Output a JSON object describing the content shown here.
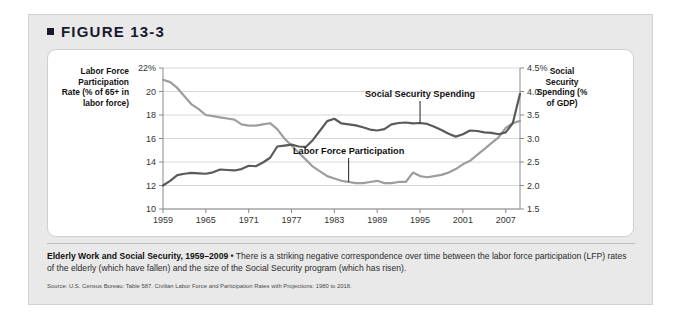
{
  "figure": {
    "header_label": "FIGURE 13-3",
    "bullet_glyph": "■"
  },
  "chart_data": {
    "type": "line",
    "title": "",
    "xlabel": "",
    "grid": "horizontal",
    "legend_position": "inline-annotations",
    "x": [
      1959,
      1960,
      1961,
      1962,
      1963,
      1964,
      1965,
      1966,
      1967,
      1968,
      1969,
      1970,
      1971,
      1972,
      1973,
      1974,
      1975,
      1976,
      1977,
      1978,
      1979,
      1980,
      1981,
      1982,
      1983,
      1984,
      1985,
      1986,
      1987,
      1988,
      1989,
      1990,
      1991,
      1992,
      1993,
      1994,
      1995,
      1996,
      1997,
      1998,
      1999,
      2000,
      2001,
      2002,
      2003,
      2004,
      2005,
      2006,
      2007,
      2008,
      2009
    ],
    "xlim": [
      1959,
      2009
    ],
    "xticks": [
      1959,
      1965,
      1971,
      1977,
      1983,
      1989,
      1995,
      2001,
      2007
    ],
    "left_axis": {
      "label": "Labor Force Participation Rate (% of 65+ in labor force)",
      "ticks": [
        "22%",
        "20",
        "18",
        "16",
        "14",
        "12",
        "10"
      ],
      "tick_values": [
        22,
        20,
        18,
        16,
        14,
        12,
        10
      ],
      "ylim": [
        10,
        22
      ]
    },
    "right_axis": {
      "label": "Social Security Spending (% of GDP)",
      "ticks": [
        "4.5%",
        "4.0",
        "3.5",
        "3.0",
        "2.5",
        "2.0",
        "1.5"
      ],
      "tick_values": [
        4.5,
        4.0,
        3.5,
        3.0,
        2.5,
        2.0,
        1.5
      ],
      "ylim": [
        1.5,
        4.5
      ]
    },
    "series": [
      {
        "name": "Labor Force Participation",
        "axis": "left",
        "unit": "% of 65+ in labor force",
        "color": "#9d9d9d",
        "annotation_label": "Labor Force Participation",
        "values": [
          21.0,
          20.8,
          20.3,
          19.6,
          18.9,
          18.5,
          18.0,
          17.9,
          17.8,
          17.7,
          17.6,
          17.2,
          17.1,
          17.1,
          17.2,
          17.3,
          16.8,
          16.0,
          15.4,
          14.8,
          14.2,
          13.6,
          13.2,
          12.8,
          12.6,
          12.4,
          12.3,
          12.2,
          12.2,
          12.3,
          12.4,
          12.2,
          12.2,
          12.3,
          12.3,
          13.1,
          12.8,
          12.7,
          12.8,
          12.9,
          13.1,
          13.4,
          13.8,
          14.1,
          14.6,
          15.1,
          15.6,
          16.1,
          16.9,
          17.3,
          17.5
        ]
      },
      {
        "name": "Social Security Spending",
        "axis": "right",
        "unit": "% of GDP",
        "color": "#5a5a5a",
        "annotation_label": "Social Security Spending",
        "values": [
          2.0,
          2.1,
          2.22,
          2.25,
          2.27,
          2.26,
          2.25,
          2.28,
          2.34,
          2.33,
          2.32,
          2.35,
          2.42,
          2.41,
          2.49,
          2.59,
          2.83,
          2.85,
          2.87,
          2.83,
          2.82,
          2.97,
          3.17,
          3.37,
          3.42,
          3.32,
          3.3,
          3.28,
          3.24,
          3.19,
          3.17,
          3.2,
          3.3,
          3.33,
          3.34,
          3.32,
          3.33,
          3.31,
          3.25,
          3.18,
          3.1,
          3.04,
          3.09,
          3.17,
          3.16,
          3.13,
          3.12,
          3.09,
          3.13,
          3.33,
          3.95
        ]
      }
    ],
    "annotations": [
      {
        "text": "Social Security Spending",
        "year": 1995,
        "target_value": 3.33,
        "axis": "right"
      },
      {
        "text": "Labor Force Participation",
        "year": 1985,
        "target_value": 12.3,
        "axis": "left"
      }
    ]
  },
  "caption": {
    "lead": "Elderly Work and Social Security, 1959–2009",
    "bullet": "•",
    "body": "There is a striking negative correspondence over time between the labor force participation (LFP) rates of the elderly (which have fallen) and the size of the Social Security program (which has risen).",
    "source": "Source: U.S. Census Bureau: Table 587. Civilian Labor Force and Participation Rates with Projections: 1980 to 2018."
  }
}
